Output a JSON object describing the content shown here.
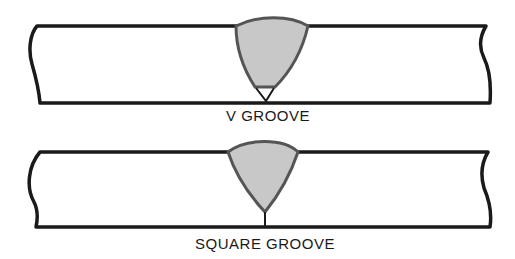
{
  "figure": {
    "diagrams": [
      {
        "id": "v-groove",
        "label": "V GROOVE",
        "weld_fill": "#c8c8c8",
        "weld_outline": "#555555"
      },
      {
        "id": "square-groove",
        "label": "SQUARE GROOVE",
        "weld_fill": "#c8c8c8",
        "weld_outline": "#555555"
      }
    ],
    "colors": {
      "plate_line": "#1a1a1a",
      "background": "#ffffff"
    }
  }
}
